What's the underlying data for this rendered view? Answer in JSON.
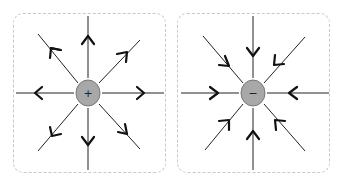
{
  "panels": [
    {
      "id": "positive",
      "sign": "+",
      "field_direction": "outward"
    },
    {
      "id": "negative",
      "sign": "−",
      "field_direction": "inward"
    }
  ],
  "colors": {
    "charge_fill": "#a8a8a8",
    "charge_stroke": "#777777",
    "line": "#222222",
    "border": "#c8c8c8"
  }
}
